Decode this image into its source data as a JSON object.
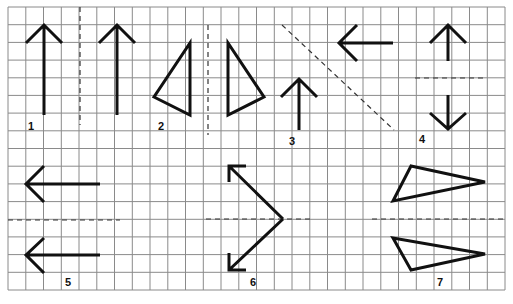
{
  "diagram": {
    "title": "",
    "grid": {
      "columns": 28,
      "rows": 16,
      "line_color": "#8a8a8a",
      "background": "#ffffff"
    },
    "stroke_color": "#111111",
    "panels": [
      {
        "label": "1",
        "figure": "up-arrow",
        "mirror_axis": "vertical dashed line",
        "image": "up-arrow"
      },
      {
        "label": "2",
        "figure": "right triangle",
        "mirror_axis": "vertical dashed line",
        "image": "mirrored triangle"
      },
      {
        "label": "3",
        "figure": "up-arrow",
        "mirror_axis": "diagonal dashed line",
        "image": "left-arrow"
      },
      {
        "label": "4",
        "figure": "up-arrow",
        "mirror_axis": "horizontal dashed line",
        "image": "down-arrow"
      },
      {
        "label": "5",
        "figure": "left-arrow",
        "mirror_axis": "horizontal dashed line",
        "image": "left-arrow"
      },
      {
        "label": "6",
        "figure": "diagonal arrow (up-left)",
        "mirror_axis": "horizontal dashed line",
        "image": "diagonal arrow (down-left)"
      },
      {
        "label": "7",
        "figure": "triangle",
        "mirror_axis": "horizontal dashed line",
        "image": "mirrored triangle"
      }
    ]
  }
}
